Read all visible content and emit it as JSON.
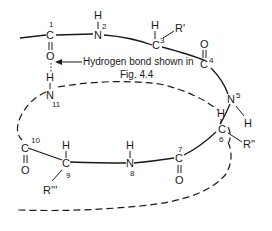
{
  "diagram": {
    "atoms": {
      "c1": {
        "symbol": "C",
        "number": "1"
      },
      "o1": {
        "symbol": "O"
      },
      "n2": {
        "symbol": "N",
        "number": "2"
      },
      "h2": {
        "symbol": "H"
      },
      "c3": {
        "symbol": "C",
        "number": "3"
      },
      "h3": {
        "symbol": "H"
      },
      "r3": {
        "symbol": "R'"
      },
      "c4": {
        "symbol": "C",
        "number": "4"
      },
      "o4": {
        "symbol": "O"
      },
      "n5": {
        "symbol": "N",
        "number": "5"
      },
      "h5": {
        "symbol": "H"
      },
      "c6": {
        "symbol": "C",
        "number": "6"
      },
      "h6": {
        "symbol": "H"
      },
      "r6": {
        "symbol": "R''"
      },
      "c7": {
        "symbol": "C",
        "number": "7"
      },
      "o7": {
        "symbol": "O"
      },
      "n8": {
        "symbol": "N",
        "number": "8"
      },
      "h8": {
        "symbol": "H"
      },
      "c9": {
        "symbol": "C",
        "number": "9"
      },
      "h9": {
        "symbol": "H"
      },
      "r9": {
        "symbol": "R'''"
      },
      "c10": {
        "symbol": "C",
        "number": "10"
      },
      "o10": {
        "symbol": "O"
      },
      "n11": {
        "symbol": "N",
        "number": "11"
      },
      "h11": {
        "symbol": "H"
      }
    },
    "annotation": {
      "line1": "Hydrogen bond shown in",
      "line2": "Fig. 4.4"
    }
  }
}
